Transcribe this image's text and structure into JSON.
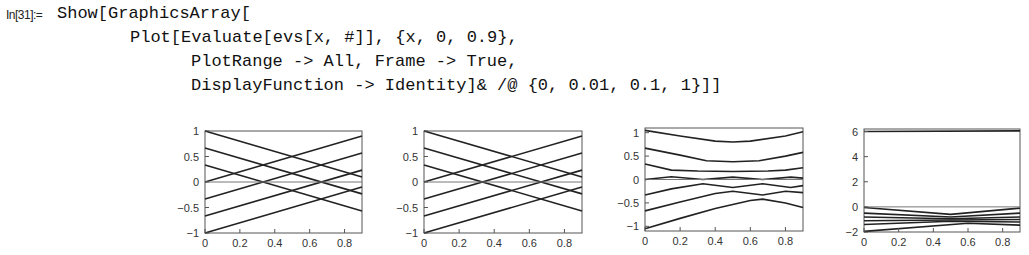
{
  "cell": {
    "label": "In[31]:=",
    "lines": [
      "Show[GraphicsArray[",
      "Plot[Evaluate[evs[x, #]], {x, 0, 0.9},",
      "PlotRange -> All, Frame -> True,",
      "DisplayFunction -> Identity]& /@ {0, 0.01, 0.1, 1}]]"
    ]
  },
  "chart_data": [
    {
      "type": "line",
      "title": "",
      "parameter": 0,
      "xlim": [
        0,
        0.9
      ],
      "ylim": [
        -1,
        1
      ],
      "x_ticks": [
        "0",
        "0.2",
        "0.4",
        "0.6",
        "0.8"
      ],
      "y_ticks": [
        "1",
        "0.5",
        "0",
        "-0.5",
        "-1"
      ],
      "series": [
        {
          "x": [
            0,
            0.9
          ],
          "y": [
            1,
            0.1
          ]
        },
        {
          "x": [
            0,
            0.9
          ],
          "y": [
            0.667,
            -0.233
          ]
        },
        {
          "x": [
            0,
            0.9
          ],
          "y": [
            0.333,
            -0.567
          ]
        },
        {
          "x": [
            0,
            0.9
          ],
          "y": [
            0,
            0.9
          ]
        },
        {
          "x": [
            0,
            0.9
          ],
          "y": [
            -0.333,
            0.567
          ]
        },
        {
          "x": [
            0,
            0.9
          ],
          "y": [
            -0.667,
            0.233
          ]
        },
        {
          "x": [
            0,
            0.9
          ],
          "y": [
            -1,
            -0.1
          ]
        },
        {
          "x": [
            0,
            0.9
          ],
          "y": [
            0,
            0
          ]
        }
      ]
    },
    {
      "type": "line",
      "title": "",
      "parameter": 0.01,
      "xlim": [
        0,
        0.9
      ],
      "ylim": [
        -1,
        1
      ],
      "x_ticks": [
        "0",
        "0.2",
        "0.4",
        "0.6",
        "0.8"
      ],
      "y_ticks": [
        "1",
        "0.5",
        "0",
        "-0.5",
        "-1"
      ],
      "series": [
        {
          "x": [
            0,
            0.9
          ],
          "y": [
            1,
            0.1
          ]
        },
        {
          "x": [
            0,
            0.9
          ],
          "y": [
            0.667,
            -0.233
          ]
        },
        {
          "x": [
            0,
            0.9
          ],
          "y": [
            0.333,
            -0.567
          ]
        },
        {
          "x": [
            0,
            0.9
          ],
          "y": [
            0,
            0.9
          ]
        },
        {
          "x": [
            0,
            0.9
          ],
          "y": [
            -0.333,
            0.567
          ]
        },
        {
          "x": [
            0,
            0.9
          ],
          "y": [
            -0.667,
            0.233
          ]
        },
        {
          "x": [
            0,
            0.9
          ],
          "y": [
            -1,
            -0.1
          ]
        },
        {
          "x": [
            0,
            0.9
          ],
          "y": [
            0,
            0
          ]
        }
      ]
    },
    {
      "type": "line",
      "title": "",
      "parameter": 0.1,
      "xlim": [
        0,
        0.9
      ],
      "ylim": [
        -1.1,
        1.1
      ],
      "x_ticks": [
        "0",
        "0.2",
        "0.4",
        "0.6",
        "0.8"
      ],
      "y_ticks": [
        "1",
        "0.5",
        "0",
        "-0.5",
        "-1"
      ],
      "series": [
        {
          "x": [
            0,
            0.2,
            0.4,
            0.5,
            0.6,
            0.8,
            0.9
          ],
          "y": [
            1.05,
            0.93,
            0.82,
            0.8,
            0.82,
            0.93,
            1.02
          ]
        },
        {
          "x": [
            0,
            0.2,
            0.35,
            0.5,
            0.65,
            0.8,
            0.9
          ],
          "y": [
            0.67,
            0.52,
            0.4,
            0.38,
            0.4,
            0.5,
            0.58
          ]
        },
        {
          "x": [
            0,
            0.15,
            0.3,
            0.5,
            0.7,
            0.8,
            0.9
          ],
          "y": [
            0.33,
            0.2,
            0.18,
            0.17,
            0.18,
            0.2,
            0.25
          ]
        },
        {
          "x": [
            0,
            0.15,
            0.33,
            0.5,
            0.67,
            0.83,
            0.9
          ],
          "y": [
            0,
            0.06,
            0,
            0.05,
            0,
            0.05,
            0.03
          ]
        },
        {
          "x": [
            0,
            0.15,
            0.33,
            0.5,
            0.67,
            0.83,
            0.9
          ],
          "y": [
            -0.33,
            -0.2,
            -0.09,
            -0.17,
            -0.09,
            -0.17,
            -0.13
          ]
        },
        {
          "x": [
            0,
            0.2,
            0.4,
            0.5,
            0.67,
            0.8,
            0.9
          ],
          "y": [
            -0.67,
            -0.48,
            -0.3,
            -0.25,
            -0.33,
            -0.25,
            -0.28
          ]
        },
        {
          "x": [
            0,
            0.2,
            0.4,
            0.6,
            0.67,
            0.8,
            0.9
          ],
          "y": [
            -1.05,
            -0.83,
            -0.62,
            -0.45,
            -0.42,
            -0.5,
            -0.6
          ]
        },
        {
          "x": [
            0,
            0.9
          ],
          "y": [
            0,
            0
          ]
        }
      ]
    },
    {
      "type": "line",
      "title": "",
      "parameter": 1,
      "xlim": [
        0,
        0.9
      ],
      "ylim": [
        -2,
        6.2
      ],
      "x_ticks": [
        "0",
        "0.2",
        "0.4",
        "0.6",
        "0.8"
      ],
      "y_ticks": [
        "6",
        "4",
        "2",
        "0",
        "-2"
      ],
      "series": [
        {
          "x": [
            0,
            0.9
          ],
          "y": [
            6,
            6.05
          ]
        },
        {
          "x": [
            0,
            0.5,
            0.9
          ],
          "y": [
            -0.05,
            -0.6,
            -0.1
          ]
        },
        {
          "x": [
            0,
            0.5,
            0.9
          ],
          "y": [
            -0.5,
            -0.8,
            -0.5
          ]
        },
        {
          "x": [
            0,
            0.5,
            0.9
          ],
          "y": [
            -0.8,
            -0.95,
            -0.8
          ]
        },
        {
          "x": [
            0,
            0.5,
            0.9
          ],
          "y": [
            -1.1,
            -1.05,
            -1.0
          ]
        },
        {
          "x": [
            0,
            0.5,
            0.9
          ],
          "y": [
            -1.4,
            -1.15,
            -1.2
          ]
        },
        {
          "x": [
            0,
            0.6,
            0.9
          ],
          "y": [
            -1.95,
            -1.3,
            -1.45
          ]
        },
        {
          "x": [
            0,
            0.9
          ],
          "y": [
            0,
            0
          ]
        }
      ]
    }
  ]
}
